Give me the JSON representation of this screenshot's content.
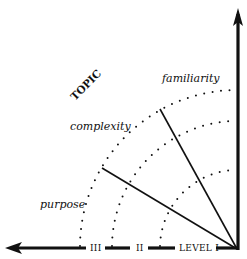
{
  "diagram": {
    "type": "quadrant-levels",
    "top_fragment": "",
    "axis_label_rotated": "TOPIC",
    "dimension_labels": {
      "familiarity": "familiarity",
      "complexity": "complexity",
      "purpose": "purpose"
    },
    "levels": [
      "III",
      "II",
      "LEVEL I"
    ],
    "colors": {
      "ink": "#111111",
      "background": "#ffffff"
    }
  }
}
